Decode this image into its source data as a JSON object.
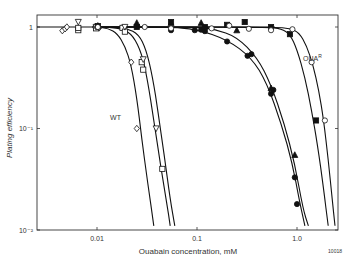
{
  "chart_data": {
    "type": "line",
    "title": "",
    "xlabel": "Ouabain concentration, mM",
    "ylabel": "Plating efficiency",
    "xscale": "log",
    "yscale": "log",
    "xlim": [
      0.0028,
      3.0
    ],
    "ylim": [
      0.01,
      1.3
    ],
    "x_ticks": [
      {
        "value": 0.01,
        "label": "0.01"
      },
      {
        "value": 0.1,
        "label": "0.1"
      },
      {
        "value": 1.0,
        "label": "1.0"
      }
    ],
    "y_ticks": [
      {
        "value": 1,
        "label": "1"
      },
      {
        "value": 0.1,
        "label": "10⁻¹"
      },
      {
        "value": 0.01,
        "label": "10⁻²"
      }
    ],
    "grid": false,
    "legend": null,
    "annotations": [
      {
        "text": "WT",
        "x": 0.0135,
        "y": 0.12
      },
      {
        "text": "OUA",
        "sup": "R",
        "x": 1.15,
        "y": 0.46
      }
    ],
    "corner_id": "10018",
    "series": [
      {
        "name": "WT (open diamond)",
        "marker": "diamond-open",
        "points": [
          [
            0.0045,
            0.92
          ],
          [
            0.0048,
            0.96
          ],
          [
            0.005,
            1.0
          ],
          [
            0.0095,
            1.0
          ],
          [
            0.0105,
            0.98
          ],
          [
            0.022,
            0.45
          ],
          [
            0.025,
            0.1
          ]
        ],
        "curve": [
          [
            0.01,
            1.0
          ],
          [
            0.013,
            0.97
          ],
          [
            0.016,
            0.86
          ],
          [
            0.019,
            0.65
          ],
          [
            0.022,
            0.42
          ],
          [
            0.025,
            0.2
          ],
          [
            0.028,
            0.08
          ],
          [
            0.032,
            0.03
          ],
          [
            0.037,
            0.011
          ]
        ]
      },
      {
        "name": "WT (open square)",
        "marker": "square-open",
        "points": [
          [
            0.0065,
            0.93
          ],
          [
            0.0065,
            0.98
          ],
          [
            0.0098,
            0.97
          ],
          [
            0.018,
            0.98
          ],
          [
            0.019,
            0.9
          ],
          [
            0.028,
            0.45
          ],
          [
            0.029,
            0.38
          ],
          [
            0.045,
            0.04
          ]
        ],
        "curve": [
          [
            0.012,
            1.0
          ],
          [
            0.018,
            0.96
          ],
          [
            0.023,
            0.82
          ],
          [
            0.028,
            0.55
          ],
          [
            0.032,
            0.3
          ],
          [
            0.037,
            0.12
          ],
          [
            0.043,
            0.045
          ],
          [
            0.05,
            0.018
          ],
          [
            0.054,
            0.011
          ]
        ]
      },
      {
        "name": "WT (open inverted triangle)",
        "marker": "triangle-down-open",
        "points": [
          [
            0.0065,
            1.12
          ],
          [
            0.0098,
            1.0
          ],
          [
            0.019,
            1.0
          ],
          [
            0.029,
            0.48
          ],
          [
            0.039,
            0.1
          ]
        ],
        "curve": [
          [
            0.014,
            1.0
          ],
          [
            0.02,
            0.97
          ],
          [
            0.026,
            0.85
          ],
          [
            0.031,
            0.6
          ],
          [
            0.036,
            0.32
          ],
          [
            0.041,
            0.14
          ],
          [
            0.047,
            0.055
          ],
          [
            0.054,
            0.02
          ],
          [
            0.06,
            0.011
          ]
        ]
      },
      {
        "name": "filled triangle",
        "marker": "triangle-filled",
        "points": [
          [
            0.0102,
            1.03
          ],
          [
            0.025,
            1.1
          ],
          [
            0.055,
            1.1
          ],
          [
            0.11,
            1.1
          ],
          [
            0.25,
            0.93
          ],
          [
            0.55,
            0.25
          ],
          [
            0.95,
            0.055
          ]
        ],
        "curve": [
          [
            0.01,
            1.0
          ],
          [
            0.1,
            1.0
          ],
          [
            0.15,
            0.95
          ],
          [
            0.25,
            0.8
          ],
          [
            0.4,
            0.5
          ],
          [
            0.55,
            0.27
          ],
          [
            0.75,
            0.11
          ],
          [
            0.95,
            0.045
          ],
          [
            1.15,
            0.016
          ],
          [
            1.3,
            0.011
          ]
        ]
      },
      {
        "name": "filled circle",
        "marker": "circle-filled",
        "points": [
          [
            0.0102,
            1.0
          ],
          [
            0.055,
            0.93
          ],
          [
            0.095,
            0.93
          ],
          [
            0.11,
            0.94
          ],
          [
            0.12,
            0.91
          ],
          [
            0.2,
            0.72
          ],
          [
            0.32,
            0.52
          ],
          [
            0.35,
            0.54
          ],
          [
            0.55,
            0.22
          ],
          [
            0.58,
            0.24
          ],
          [
            0.95,
            0.033
          ],
          [
            1.0,
            0.018
          ]
        ],
        "curve": [
          [
            0.01,
            1.0
          ],
          [
            0.05,
            1.0
          ],
          [
            0.1,
            0.95
          ],
          [
            0.2,
            0.75
          ],
          [
            0.35,
            0.5
          ],
          [
            0.5,
            0.28
          ],
          [
            0.7,
            0.11
          ],
          [
            0.9,
            0.045
          ],
          [
            1.05,
            0.02
          ],
          [
            1.2,
            0.011
          ]
        ]
      },
      {
        "name": "filled square (OUA R)",
        "marker": "square-filled",
        "points": [
          [
            0.0102,
            1.02
          ],
          [
            0.025,
            1.0
          ],
          [
            0.055,
            1.12
          ],
          [
            0.12,
            1.0
          ],
          [
            0.2,
            1.05
          ],
          [
            0.3,
            1.12
          ],
          [
            0.55,
            1.0
          ],
          [
            0.85,
            0.85
          ],
          [
            1.55,
            0.12
          ]
        ],
        "curve": [
          [
            0.01,
            1.0
          ],
          [
            0.5,
            1.0
          ],
          [
            0.7,
            0.96
          ],
          [
            0.85,
            0.85
          ],
          [
            1.0,
            0.6
          ],
          [
            1.2,
            0.32
          ],
          [
            1.4,
            0.15
          ],
          [
            1.6,
            0.07
          ],
          [
            1.85,
            0.025
          ],
          [
            2.05,
            0.011
          ]
        ]
      },
      {
        "name": "open circle (OUA R)",
        "marker": "circle-open",
        "points": [
          [
            0.0102,
            1.0
          ],
          [
            0.03,
            1.0
          ],
          [
            0.055,
            0.97
          ],
          [
            0.14,
            0.97
          ],
          [
            0.21,
            1.03
          ],
          [
            0.33,
            0.96
          ],
          [
            0.55,
            0.93
          ],
          [
            0.9,
            0.95
          ],
          [
            1.4,
            0.45
          ],
          [
            1.9,
            0.12
          ]
        ],
        "curve": [
          [
            0.01,
            1.0
          ],
          [
            0.6,
            1.0
          ],
          [
            0.85,
            0.97
          ],
          [
            1.05,
            0.88
          ],
          [
            1.25,
            0.65
          ],
          [
            1.45,
            0.42
          ],
          [
            1.65,
            0.24
          ],
          [
            1.85,
            0.12
          ],
          [
            2.05,
            0.05
          ],
          [
            2.25,
            0.02
          ],
          [
            2.4,
            0.011
          ]
        ]
      }
    ]
  }
}
